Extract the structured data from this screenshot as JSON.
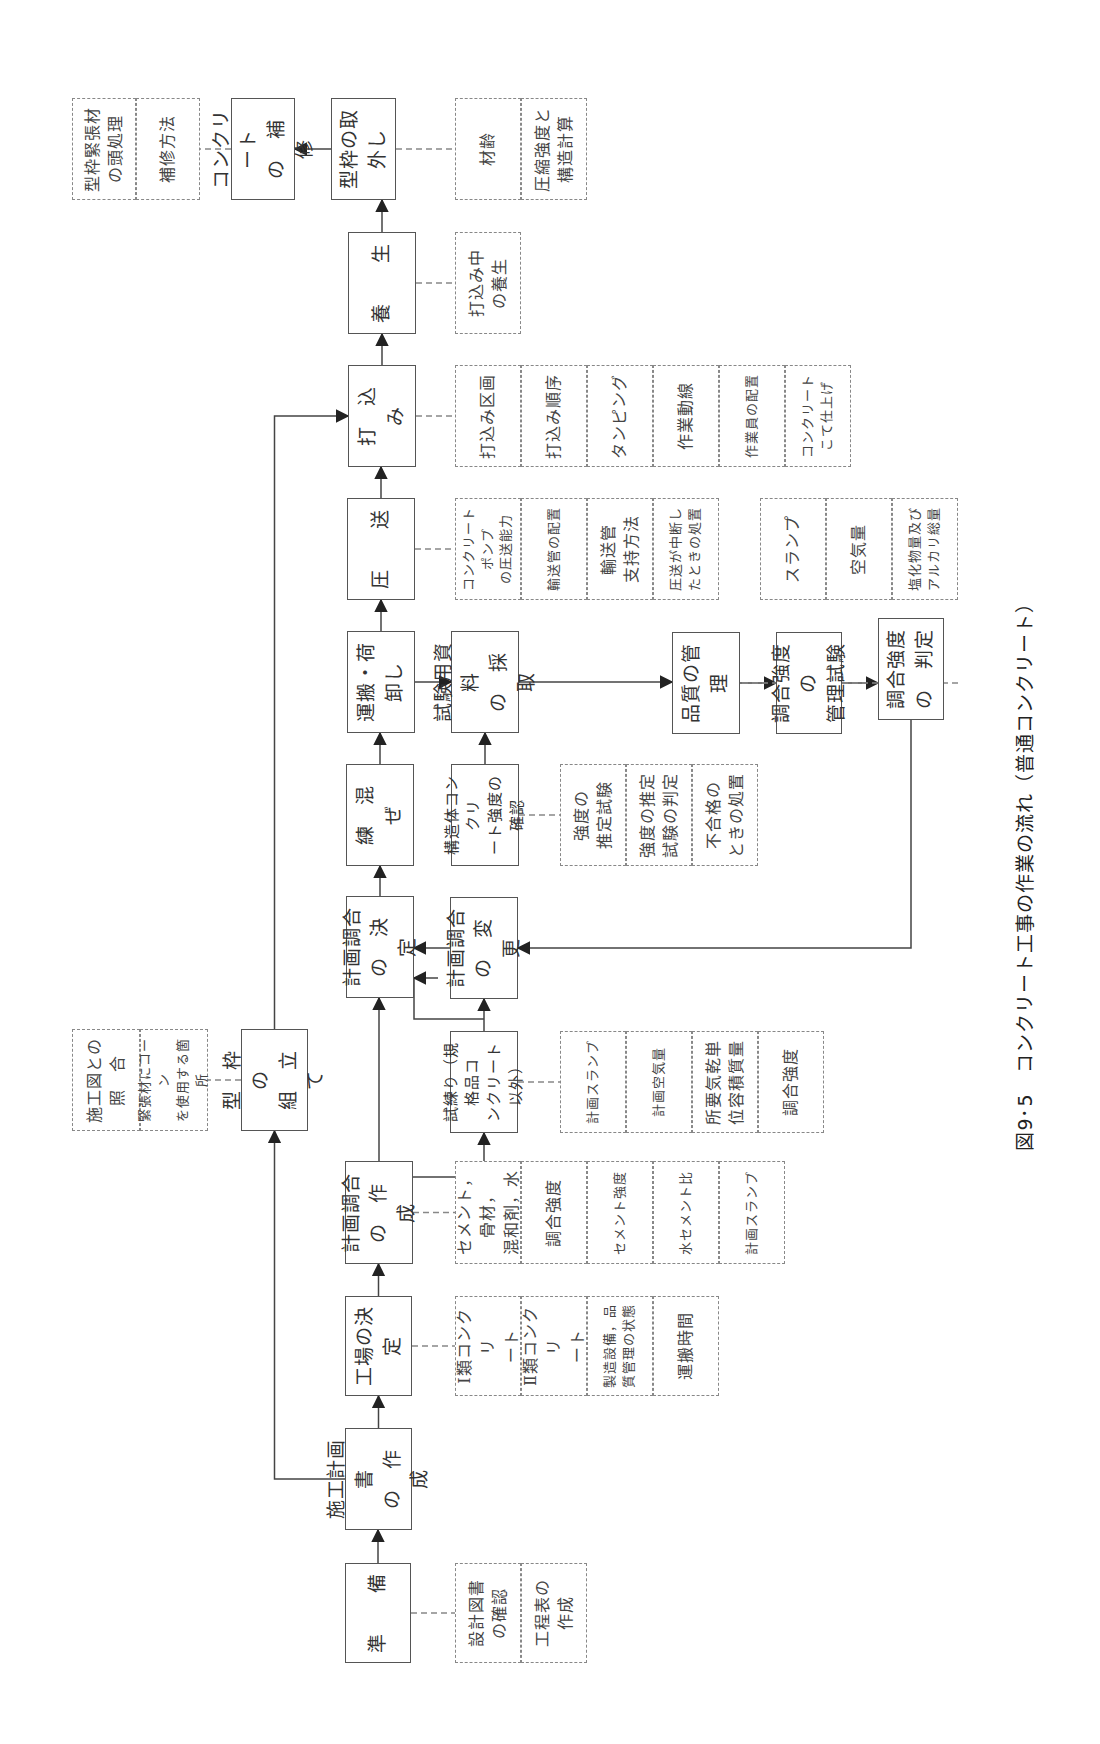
{
  "caption": "図9･5　コンクリート工事の作業の流れ（普通コンクリート）",
  "nodes": {
    "junbi": "準　　備",
    "sekou_keikaku": "施工計画書\nの　作　成",
    "kataw_kumitate": "型　枠　の\n組　立　て",
    "koujou": "工場の決定",
    "keikaku_chougou_sakusei": "計画調合\nの　作　成",
    "keikaku_chougou_kettei": "計画調合\nの　決　定",
    "neri_maze": "練　混　ぜ",
    "unpan": "運搬・荷卸し",
    "assou": "圧　　送",
    "uchikomi": "打　込　み",
    "yousei": "養　　生",
    "katawaku_torihazushi": "型枠の取外し",
    "hoshuu": "コンクリート\nの　補　修",
    "shineri": "試練り（規格品コ\nンクリート以外）",
    "keikaku_henkou": "計画調合\nの　変　更",
    "kouzoutai": "構造体コンクリ\nート強度の確認",
    "shiken_saishu": "試験用資料\nの　採　取",
    "hinshitsu": "品質の管理",
    "chougou_kanri": "調合強度の\n管理試験",
    "chougou_hantei": "調合強度\nの　判定"
  },
  "details": {
    "junbi": [
      "設計図書\nの確認",
      "工程表の\n作成"
    ],
    "kataw_kumitate": [
      "施工図との\n照　合",
      "緊張材にコーン\nを使用する箇所"
    ],
    "koujou": [
      "Ⅰ類コンクリ\nート",
      "Ⅱ類コンクリ\nート",
      "製造設備，品\n質管理の状態",
      "運搬時間"
    ],
    "keikaku_chougou_sakusei": [
      "セメント，骨材，\n混和剤，水",
      "調合強度",
      "セメント強度",
      "水セメント比",
      "計画スランプ"
    ],
    "shineri": [
      "計画スランプ",
      "計画空気量",
      "所要気乾単\n位容積質量",
      "調合強度"
    ],
    "kouzoutai": [
      "強度の\n推定試験",
      "強度の推定\n試験の判定",
      "不合格の\nときの処置"
    ],
    "assou": [
      "コンクリートポンプ\nの圧送能力",
      "輸送管の配置",
      "輸送管\n支持方法",
      "圧送が中断し\nたときの処置"
    ],
    "uchikomi": [
      "打込み区画",
      "打込み順序",
      "タンピング",
      "作業動線",
      "作業員の配置",
      "コンクリート\nこて仕上げ"
    ],
    "hinshitsu": [
      "スランプ",
      "空気量",
      "塩化物量及び\nアルカリ総量"
    ],
    "yousei": [
      "打込み中\nの養生"
    ],
    "katawaku_torihazushi": [
      "材齢",
      "圧縮強度と\n構造計算"
    ],
    "hoshuu": [
      "型枠緊張材\nの頭処理",
      "補修方法"
    ]
  }
}
